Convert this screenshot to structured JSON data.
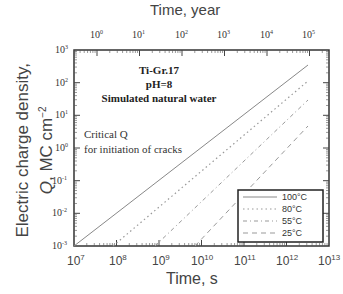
{
  "chart_data": {
    "type": "line",
    "title": "",
    "annotation": [
      "Ti-Gr.17",
      "pH=8",
      "Simulated natural water"
    ],
    "note": [
      "Critical Q",
      "for initiation of cracks"
    ],
    "xlabel": "Time, s",
    "x2label": "Time, year",
    "ylabel_line1": "Electric charge density,",
    "ylabel_line2": "Q, MC cm⁻²",
    "xscale": "log",
    "yscale": "log",
    "xlim": [
      10000000.0,
      10000000000000.0
    ],
    "ylim": [
      0.001,
      1000.0
    ],
    "x_ticks": [
      "10^7",
      "10^8",
      "10^9",
      "10^10",
      "10^11",
      "10^12",
      "10^13"
    ],
    "x2_ticks": [
      "10^0",
      "10^1",
      "10^2",
      "10^3",
      "10^4",
      "10^5"
    ],
    "y_ticks": [
      "10^-3",
      "10^-2",
      "10^-1",
      "10^0",
      "10^1",
      "10^2",
      "10^3"
    ],
    "legend_position": "lower right",
    "series": [
      {
        "name": "100°C",
        "style": "solid",
        "x": [
          10000000.0,
          3200000000000.0
        ],
        "y": [
          0.001,
          300
        ]
      },
      {
        "name": "80°C",
        "style": "dotted",
        "x": [
          80000000.0,
          3200000000000.0
        ],
        "y": [
          0.001,
          100
        ]
      },
      {
        "name": "55°C",
        "style": "dash-dot",
        "x": [
          800000000.0,
          3200000000000.0
        ],
        "y": [
          0.001,
          25
        ]
      },
      {
        "name": "25°C",
        "style": "dashed",
        "x": [
          7000000000.0,
          3200000000000.0
        ],
        "y": [
          0.001,
          4.5
        ]
      }
    ]
  },
  "labels": {
    "top_axis": "Time, year",
    "bottom_axis": "Time, s",
    "y_axis_1": "Electric charge density,",
    "y_axis_2": "Q, MC cm",
    "y_axis_sup": "−2",
    "ann1": "Ti-Gr.17",
    "ann2": "pH=8",
    "ann3": "Simulated natural water",
    "note1": "Critical Q",
    "note2": "for initiation of cracks"
  },
  "xticks": [
    {
      "b": "10",
      "e": "7"
    },
    {
      "b": "10",
      "e": "8"
    },
    {
      "b": "10",
      "e": "9"
    },
    {
      "b": "10",
      "e": "10"
    },
    {
      "b": "10",
      "e": "11"
    },
    {
      "b": "10",
      "e": "12"
    },
    {
      "b": "10",
      "e": "13"
    }
  ],
  "x2ticks": [
    {
      "b": "10",
      "e": "0"
    },
    {
      "b": "10",
      "e": "1"
    },
    {
      "b": "10",
      "e": "2"
    },
    {
      "b": "10",
      "e": "3"
    },
    {
      "b": "10",
      "e": "4"
    },
    {
      "b": "10",
      "e": "5"
    }
  ],
  "yticks": [
    {
      "b": "10",
      "e": "3"
    },
    {
      "b": "10",
      "e": "2"
    },
    {
      "b": "10",
      "e": "1"
    },
    {
      "b": "10",
      "e": "0"
    },
    {
      "b": "10",
      "e": "-1"
    },
    {
      "b": "10",
      "e": "-2"
    },
    {
      "b": "10",
      "e": "-3"
    }
  ],
  "legend": [
    "100°C",
    "80°C",
    "55°C",
    "25°C"
  ]
}
